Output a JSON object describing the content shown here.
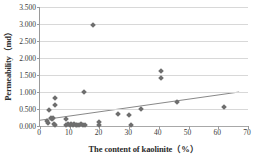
{
  "chart_data": {
    "type": "scatter",
    "title": "",
    "xlabel": "The content of kaolinite（%）",
    "ylabel": "Permeability（md）",
    "xlim": [
      0,
      70
    ],
    "ylim": [
      0,
      3.5
    ],
    "xticks": [
      "0",
      "10",
      "20",
      "30",
      "40",
      "50",
      "60",
      "70"
    ],
    "xtick_values": [
      0,
      10,
      20,
      30,
      40,
      50,
      60,
      70
    ],
    "yticks": [
      "0.000",
      "0.500",
      "1.000",
      "1.500",
      "2.000",
      "2.500",
      "3.000",
      "3.500"
    ],
    "ytick_values": [
      0,
      0.5,
      1.0,
      1.5,
      2.0,
      2.5,
      3.0,
      3.5
    ],
    "grid": "horizontal",
    "legend": "none",
    "marker_color": "#6e6e6e",
    "marker_shape": "diamond",
    "gridline_color": "#d8d8d8",
    "axis_color": "#9a9a9a",
    "points": [
      {
        "x": 2.2,
        "y": 0.15
      },
      {
        "x": 2.6,
        "y": 0.1
      },
      {
        "x": 3.0,
        "y": 0.47
      },
      {
        "x": 3.6,
        "y": 0.24
      },
      {
        "x": 4.0,
        "y": 0.2
      },
      {
        "x": 4.4,
        "y": 0.25
      },
      {
        "x": 4.6,
        "y": 0.06
      },
      {
        "x": 5.0,
        "y": 0.82
      },
      {
        "x": 5.0,
        "y": 0.62
      },
      {
        "x": 5.2,
        "y": 0.04
      },
      {
        "x": 8.6,
        "y": 0.22
      },
      {
        "x": 8.8,
        "y": 0.03
      },
      {
        "x": 9.4,
        "y": 0.05
      },
      {
        "x": 10.0,
        "y": 0.02
      },
      {
        "x": 10.6,
        "y": 0.06
      },
      {
        "x": 11.0,
        "y": 0.03
      },
      {
        "x": 11.6,
        "y": 0.05
      },
      {
        "x": 12.0,
        "y": 0.02
      },
      {
        "x": 12.6,
        "y": 0.04
      },
      {
        "x": 13.2,
        "y": 0.03
      },
      {
        "x": 13.8,
        "y": 0.05
      },
      {
        "x": 14.4,
        "y": 0.02
      },
      {
        "x": 14.8,
        "y": 1.0
      },
      {
        "x": 15.0,
        "y": 0.03
      },
      {
        "x": 18.0,
        "y": 2.97
      },
      {
        "x": 20.0,
        "y": 0.13
      },
      {
        "x": 20.0,
        "y": 0.02
      },
      {
        "x": 26.2,
        "y": 0.35
      },
      {
        "x": 29.8,
        "y": 0.31
      },
      {
        "x": 30.6,
        "y": 0.02
      },
      {
        "x": 34.0,
        "y": 0.5
      },
      {
        "x": 40.8,
        "y": 1.61
      },
      {
        "x": 40.8,
        "y": 1.4
      },
      {
        "x": 46.2,
        "y": 0.72
      },
      {
        "x": 61.8,
        "y": 0.57
      }
    ],
    "trendline": {
      "type": "linear",
      "x_start": 0.0,
      "y_start": 0.17,
      "x_end": 67.0,
      "y_end": 1.0,
      "color": "#7a7a7a"
    }
  }
}
